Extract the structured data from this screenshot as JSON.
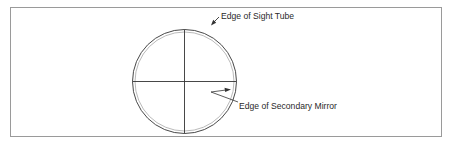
{
  "diagram": {
    "labels": {
      "sight_tube": "Edge of Sight Tube",
      "secondary_mirror": "Edge of Secondary Mirror"
    },
    "colors": {
      "stroke": "#333333",
      "inner_ring": "#9a9a9a",
      "frame": "#9a9a9a",
      "background": "#ffffff"
    }
  }
}
